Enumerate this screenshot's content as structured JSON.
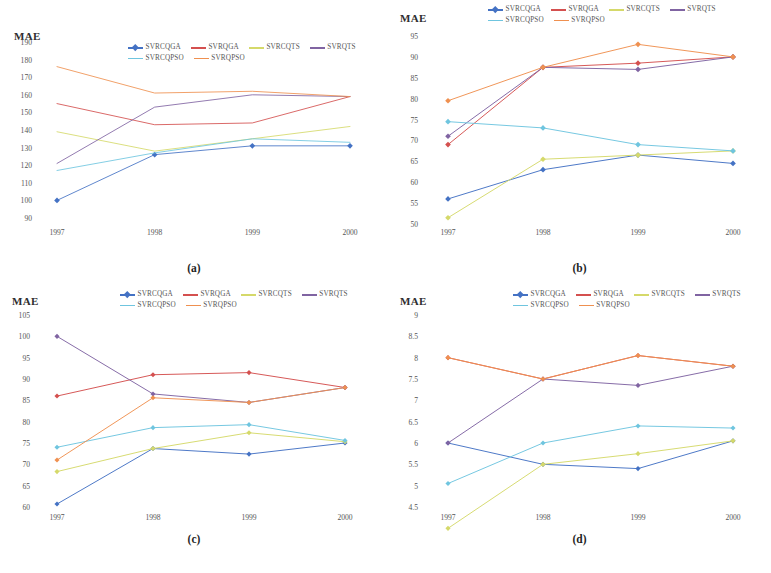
{
  "figure": {
    "axis_title": "MAE",
    "x_categories": [
      "1997",
      "1998",
      "1999",
      "2000"
    ],
    "series_names": [
      "SVRCQGA",
      "SVRQGA",
      "SVRCQTS",
      "SVRQTS",
      "SVRCQPSO",
      "SVRQPSO"
    ],
    "series_colors": [
      "#4472c4",
      "#d4504f",
      "#d5d96a",
      "#8064a2",
      "#6fc5df",
      "#ef9050"
    ],
    "captions": {
      "a": "(a)",
      "b": "(b)",
      "c": "(c)",
      "d": "(d)"
    }
  },
  "chart_data": [
    {
      "id": "a",
      "type": "line",
      "title": "(a)",
      "xlabel": "",
      "ylabel": "MAE",
      "x": [
        "1997",
        "1998",
        "1999",
        "2000"
      ],
      "categories": [
        "1997",
        "1998",
        "1999",
        "2000"
      ],
      "ylim": [
        90,
        190
      ],
      "yticks": [
        190,
        180,
        170,
        160,
        150,
        140,
        130,
        120,
        110,
        100,
        90
      ],
      "grid": false,
      "legend_position": "top",
      "series": [
        {
          "name": "SVRCQGA",
          "color": "#4472c4",
          "values": [
            100,
            126,
            131,
            131
          ]
        },
        {
          "name": "SVRQGA",
          "color": "#d4504f",
          "values": [
            155,
            143,
            144,
            159
          ]
        },
        {
          "name": "SVRCQTS",
          "color": "#d5d96a",
          "values": [
            139,
            128,
            135,
            142
          ]
        },
        {
          "name": "SVRQTS",
          "color": "#8064a2",
          "values": [
            121,
            153,
            160,
            159
          ]
        },
        {
          "name": "SVRCQPSO",
          "color": "#6fc5df",
          "values": [
            117,
            127,
            135,
            133
          ]
        },
        {
          "name": "SVRQPSO",
          "color": "#ef9050",
          "values": [
            176,
            161,
            162,
            159
          ]
        }
      ]
    },
    {
      "id": "b",
      "type": "line",
      "title": "(b)",
      "xlabel": "",
      "ylabel": "MAE",
      "x": [
        "1997",
        "1998",
        "1999",
        "2000"
      ],
      "categories": [
        "1997",
        "1998",
        "1999",
        "2000"
      ],
      "ylim": [
        50,
        95
      ],
      "yticks": [
        95,
        90,
        85,
        80,
        75,
        70,
        65,
        60,
        55,
        50
      ],
      "grid": false,
      "legend_position": "top",
      "series": [
        {
          "name": "SVRCQGA",
          "color": "#4472c4",
          "values": [
            56,
            63,
            66.5,
            64.5
          ]
        },
        {
          "name": "SVRQGA",
          "color": "#d4504f",
          "values": [
            69,
            87.5,
            88.5,
            90
          ]
        },
        {
          "name": "SVRCQTS",
          "color": "#d5d96a",
          "values": [
            51.5,
            65.5,
            66.5,
            67.5
          ]
        },
        {
          "name": "SVRQTS",
          "color": "#8064a2",
          "values": [
            71,
            87.5,
            87,
            90
          ]
        },
        {
          "name": "SVRCQPSO",
          "color": "#6fc5df",
          "values": [
            74.5,
            73,
            69,
            67.5
          ]
        },
        {
          "name": "SVRQPSO",
          "color": "#ef9050",
          "values": [
            79.5,
            87.5,
            93,
            90
          ]
        }
      ]
    },
    {
      "id": "c",
      "type": "line",
      "title": "(c)",
      "xlabel": "",
      "ylabel": "MAE",
      "x": [
        "1997",
        "1998",
        "1999",
        "2000"
      ],
      "categories": [
        "1997",
        "1998",
        "1999",
        "2000"
      ],
      "ylim": [
        60,
        105
      ],
      "yticks": [
        105,
        100,
        95,
        90,
        85,
        80,
        75,
        70,
        65,
        60
      ],
      "grid": false,
      "legend_position": "top",
      "series": [
        {
          "name": "SVRCQGA",
          "color": "#4472c4",
          "values": [
            60.7,
            73.7,
            72.4,
            75
          ]
        },
        {
          "name": "SVRQGA",
          "color": "#d4504f",
          "values": [
            86,
            91,
            91.5,
            88
          ]
        },
        {
          "name": "SVRCQTS",
          "color": "#d5d96a",
          "values": [
            68.3,
            73.7,
            77.4,
            75.3
          ]
        },
        {
          "name": "SVRQTS",
          "color": "#8064a2",
          "values": [
            100,
            86.5,
            84.5,
            88
          ]
        },
        {
          "name": "SVRCQPSO",
          "color": "#6fc5df",
          "values": [
            74,
            78.6,
            79.3,
            75.6
          ]
        },
        {
          "name": "SVRQPSO",
          "color": "#ef9050",
          "values": [
            71,
            85.6,
            84.5,
            88
          ]
        }
      ]
    },
    {
      "id": "d",
      "type": "line",
      "title": "(d)",
      "xlabel": "",
      "ylabel": "MAE",
      "x": [
        "1997",
        "1998",
        "1999",
        "2000"
      ],
      "categories": [
        "1997",
        "1998",
        "1999",
        "2000"
      ],
      "ylim": [
        4.5,
        9
      ],
      "yticks": [
        "9",
        "8.5",
        "8",
        "7.5",
        "7",
        "6.5",
        "6",
        "5.5",
        "5",
        "4.5"
      ],
      "ytick_values": [
        9,
        8.5,
        8,
        7.5,
        7,
        6.5,
        6,
        5.5,
        5,
        4.5
      ],
      "grid": false,
      "legend_position": "top",
      "series": [
        {
          "name": "SVRCQGA",
          "color": "#4472c4",
          "values": [
            6.0,
            5.5,
            5.4,
            6.05
          ]
        },
        {
          "name": "SVRQGA",
          "color": "#d4504f",
          "values": [
            8.0,
            7.5,
            8.05,
            7.8
          ]
        },
        {
          "name": "SVRCQTS",
          "color": "#d5d96a",
          "values": [
            4.0,
            5.5,
            5.75,
            6.05
          ]
        },
        {
          "name": "SVRQTS",
          "color": "#8064a2",
          "values": [
            6.0,
            7.5,
            7.35,
            7.8
          ]
        },
        {
          "name": "SVRCQPSO",
          "color": "#6fc5df",
          "values": [
            5.05,
            6.0,
            6.4,
            6.35
          ]
        },
        {
          "name": "SVRQPSO",
          "color": "#ef9050",
          "values": [
            8.0,
            7.5,
            8.05,
            7.8
          ]
        }
      ]
    }
  ]
}
